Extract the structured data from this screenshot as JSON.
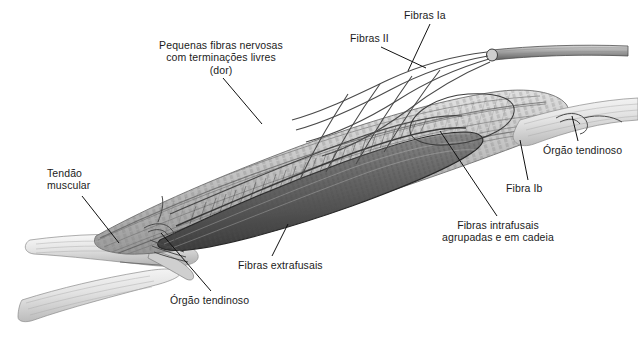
{
  "figure": {
    "background_color": "#ffffff",
    "ink_color": "#1b1b1b",
    "width": 638,
    "height": 347
  },
  "labels": [
    {
      "id": "pequenas-fibras-nervosas",
      "text": "Pequenas fibras nervosas\ncom terminações livres\n(dor)",
      "align": "center"
    },
    {
      "id": "fibras-ia",
      "text": "Fibras Ia",
      "align": "left"
    },
    {
      "id": "fibras-ii",
      "text": "Fibras II",
      "align": "left"
    },
    {
      "id": "orgao-tendinoso-direita",
      "text": "Órgão tendinoso",
      "align": "left"
    },
    {
      "id": "fibra-ib",
      "text": "Fibra Ib",
      "align": "left"
    },
    {
      "id": "fibras-intrafusais",
      "text": "Fibras intrafusais\nagrupadas e em cadeia",
      "align": "center"
    },
    {
      "id": "tendao-muscular",
      "text": "Tendão\nmuscular",
      "align": "left"
    },
    {
      "id": "fibras-extrafusais",
      "text": "Fibras extrafusais",
      "align": "left"
    },
    {
      "id": "orgao-tendinoso-esquerda",
      "text": "Órgão tendinoso",
      "align": "left"
    }
  ],
  "illustration": {
    "subject": "muscle spindle within skeletal muscle belly with tendons",
    "style": "grayscale pencil drawing",
    "parts": [
      "muscle-belly",
      "muscle-spindle-capsule",
      "intrafusal-fibers",
      "extrafusal-fibers",
      "nerve-trunk",
      "nerve-branches",
      "left-tendon",
      "right-tendon",
      "golgi-tendon-organ"
    ]
  }
}
